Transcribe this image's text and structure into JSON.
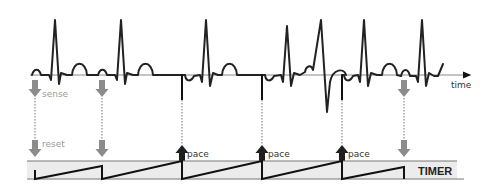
{
  "diagram": {
    "type": "pacemaker-timing-diagram",
    "labels": {
      "time_axis": "time",
      "sense": "sense",
      "reset": "reset",
      "pace": "pace",
      "timer": "TIMER"
    },
    "colors": {
      "ecg_trace": "#222222",
      "baseline": "#888888",
      "sense_arrow": "#8c8c8c",
      "pace_arrow": "#1e1e1e",
      "timer_band": "#ececec",
      "sense_text": "#9a9a9a",
      "pace_text": "#333333"
    },
    "events": [
      {
        "x": 35,
        "kind": "sense",
        "label": "sense",
        "reset_label": "reset"
      },
      {
        "x": 102,
        "kind": "sense"
      },
      {
        "x": 182,
        "kind": "pace",
        "label": "pace"
      },
      {
        "x": 262,
        "kind": "pace",
        "label": "pace"
      },
      {
        "x": 342,
        "kind": "pace",
        "label": "pace"
      },
      {
        "x": 404,
        "kind": "sense"
      }
    ]
  }
}
